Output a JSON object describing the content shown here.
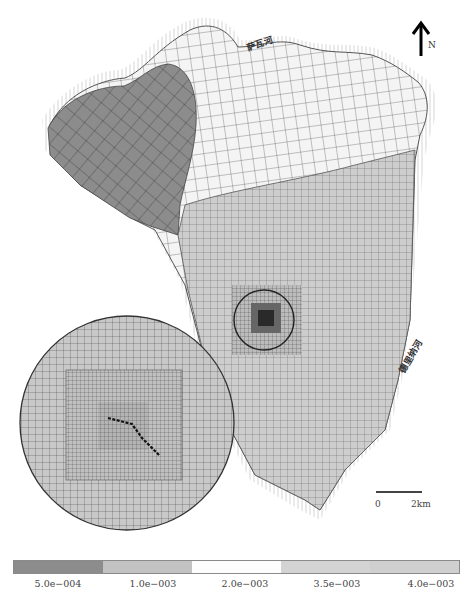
{
  "map": {
    "title": "",
    "type": "finite-element mesh, hydraulic conductivity zonation",
    "north_arrow": {
      "label": "N",
      "icon": "north-arrow-icon"
    },
    "rivers": [
      {
        "name": "萨瓦河",
        "position": "top"
      },
      {
        "name": "德里纳河",
        "position": "right"
      }
    ],
    "scale_bar": {
      "start": "0",
      "end": "2km"
    },
    "inset": {
      "description": "magnified view of refined mesh around central pit"
    }
  },
  "legend": {
    "items": [
      {
        "label": "5.0e−004",
        "color": "#8c8c8c"
      },
      {
        "label": "1.0e−003",
        "color": "#c2c2c2"
      },
      {
        "label": "2.0e−003",
        "color": "#fdfdfd"
      },
      {
        "label": "3.5e−003",
        "color": "#d3d3d3"
      },
      {
        "label": "4.0e−003",
        "color": "#cfcfcf"
      }
    ]
  },
  "colors": {
    "zone_dark": "#8c8c8c",
    "zone_mid": "#c4c4c4",
    "zone_light": "#f4f4f4",
    "zone_lower": "#cdcdcd",
    "mesh_line": "#3a3a3a"
  }
}
